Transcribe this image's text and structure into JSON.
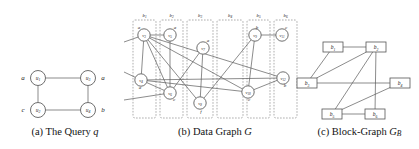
{
  "figure": {
    "panels": [
      {
        "id": "query",
        "caption_prefix": "(a)",
        "caption_text": "The Query",
        "caption_italic": "q"
      },
      {
        "id": "data-graph",
        "caption_prefix": "(b)",
        "caption_text": "Data Graph",
        "caption_italic": "G"
      },
      {
        "id": "block-graph",
        "caption_prefix": "(c)",
        "caption_text": "Block-Graph",
        "caption_italic": "G",
        "caption_italic_sub": "B"
      }
    ]
  },
  "query_graph": {
    "nodes": [
      {
        "id": "u1",
        "base": "u",
        "sub": "1",
        "attr": "a",
        "attr_side": "left",
        "x": 38,
        "y": 78
      },
      {
        "id": "u3",
        "base": "u",
        "sub": "3",
        "attr": "a",
        "attr_side": "right",
        "x": 88,
        "y": 78
      },
      {
        "id": "u2",
        "base": "u",
        "sub": "2",
        "attr": "c",
        "attr_side": "left",
        "x": 38,
        "y": 110
      },
      {
        "id": "u4",
        "base": "u",
        "sub": "4",
        "attr": "b",
        "attr_side": "right",
        "x": 88,
        "y": 110
      }
    ],
    "edges": [
      {
        "from": "u1",
        "to": "u3"
      },
      {
        "from": "u1",
        "to": "u2"
      },
      {
        "from": "u3",
        "to": "u4"
      },
      {
        "from": "u2",
        "to": "u4"
      }
    ]
  },
  "data_graph": {
    "blocks": [
      {
        "id": "b1",
        "base": "b",
        "sub": "1",
        "x": 133,
        "y": 20,
        "w": 23,
        "h": 98
      },
      {
        "id": "b2",
        "base": "b",
        "sub": "2",
        "x": 160,
        "y": 20,
        "w": 23,
        "h": 98
      },
      {
        "id": "b3",
        "base": "b",
        "sub": "3",
        "x": 187,
        "y": 20,
        "w": 26,
        "h": 98
      },
      {
        "id": "b4",
        "base": "b",
        "sub": "4",
        "x": 217,
        "y": 20,
        "w": 26,
        "h": 98
      },
      {
        "id": "b5",
        "base": "b",
        "sub": "5",
        "x": 247,
        "y": 20,
        "w": 23,
        "h": 98
      },
      {
        "id": "b6",
        "base": "b",
        "sub": "6",
        "x": 274,
        "y": 20,
        "w": 23,
        "h": 98
      }
    ],
    "nodes": [
      {
        "id": "v3",
        "base": "v",
        "sub": "3",
        "attr": "a",
        "attr_dx": -5,
        "attr_dy": -6,
        "x": 144,
        "y": 35
      },
      {
        "id": "v4",
        "base": "v",
        "sub": "4",
        "attr": "a",
        "attr_dx": -1,
        "attr_dy": 9,
        "x": 141,
        "y": 80
      },
      {
        "id": "v5",
        "base": "v",
        "sub": "5",
        "attr": "a",
        "attr_dx": 5,
        "attr_dy": -6,
        "x": 170,
        "y": 35
      },
      {
        "id": "v6",
        "base": "v",
        "sub": "6",
        "attr": "c",
        "attr_dx": 4,
        "attr_dy": 8,
        "x": 170,
        "y": 93
      },
      {
        "id": "v7",
        "base": "v",
        "sub": "7",
        "attr": "a",
        "attr_dx": 5,
        "attr_dy": -6,
        "x": 203,
        "y": 48
      },
      {
        "id": "v8",
        "base": "v",
        "sub": "8",
        "attr": "f",
        "attr_dx": 1,
        "attr_dy": 10,
        "x": 200,
        "y": 103
      },
      {
        "id": "v9",
        "base": "v",
        "sub": "9",
        "attr": "b",
        "attr_dx": 2,
        "attr_dy": -6,
        "x": 255,
        "y": 35
      },
      {
        "id": "v10",
        "base": "v",
        "sub": "10",
        "attr": "c",
        "attr_dx": 1,
        "attr_dy": 9,
        "x": 248,
        "y": 92
      },
      {
        "id": "v11",
        "base": "v",
        "sub": "11",
        "attr": "c",
        "attr_dx": 4,
        "attr_dy": -6,
        "x": 282,
        "y": 35
      },
      {
        "id": "v12",
        "base": "v",
        "sub": "12",
        "attr": "b",
        "attr_dx": 2,
        "attr_dy": 9,
        "x": 283,
        "y": 78
      }
    ],
    "edges": [
      {
        "from": "v3",
        "to": "v5"
      },
      {
        "from": "v3",
        "to": "v4"
      },
      {
        "from": "v3",
        "to": "v6"
      },
      {
        "from": "v3",
        "to": "v8"
      },
      {
        "from": "v3",
        "to": "v10"
      },
      {
        "from": "v3",
        "to": "v12"
      },
      {
        "from": "v5",
        "to": "v6"
      },
      {
        "from": "v4",
        "to": "v6"
      },
      {
        "from": "v4",
        "to": "v12"
      },
      {
        "from": "v6",
        "to": "v7"
      },
      {
        "from": "v7",
        "to": "v8"
      },
      {
        "from": "v8",
        "to": "v9"
      },
      {
        "from": "v9",
        "to": "v11"
      },
      {
        "from": "v9",
        "to": "v10"
      },
      {
        "from": "v10",
        "to": "v12"
      },
      {
        "from": "v4",
        "to": "v10"
      }
    ],
    "left_stub_edges": [
      {
        "to": "v3",
        "x": 124,
        "y": 42
      },
      {
        "to": "v4",
        "x": 124,
        "y": 72
      },
      {
        "to": "v6",
        "x": 124,
        "y": 100
      }
    ]
  },
  "block_graph": {
    "nodes": [
      {
        "id": "b1",
        "base": "b",
        "sub": "1",
        "x": 333,
        "y": 47
      },
      {
        "id": "b2",
        "base": "b",
        "sub": "2",
        "x": 376,
        "y": 47
      },
      {
        "id": "b3",
        "base": "b",
        "sub": "3",
        "x": 307,
        "y": 83
      },
      {
        "id": "b4",
        "base": "b",
        "sub": "4",
        "x": 400,
        "y": 83
      },
      {
        "id": "b5",
        "base": "b",
        "sub": "5",
        "x": 332,
        "y": 114
      },
      {
        "id": "b6",
        "base": "b",
        "sub": "6",
        "x": 375,
        "y": 114
      }
    ],
    "edges": [
      {
        "from": "b1",
        "to": "b2"
      },
      {
        "from": "b1",
        "to": "b3"
      },
      {
        "from": "b2",
        "to": "b3"
      },
      {
        "from": "b2",
        "to": "b5"
      },
      {
        "from": "b2",
        "to": "b6"
      },
      {
        "from": "b3",
        "to": "b4"
      },
      {
        "from": "b4",
        "to": "b5"
      },
      {
        "from": "b5",
        "to": "b6"
      }
    ]
  },
  "colors": {
    "background": "#ffffff",
    "stroke": "#5a5a5a",
    "block_border": "#8a8a8a",
    "text": "#232323"
  }
}
